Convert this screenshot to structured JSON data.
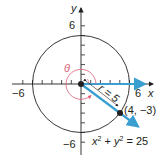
{
  "figure": {
    "axes": {
      "x_label": "x",
      "y_label": "y",
      "x_min_label": "−6",
      "x_max_label": "6",
      "y_max_label": "6",
      "y_min_label": "−6",
      "range": [
        -6,
        6
      ]
    },
    "circle": {
      "equation_lhs": "x",
      "equation_full": "x² + y² = 25",
      "radius": 5
    },
    "point": {
      "label": "(4, −3)",
      "x": 4,
      "y": -3
    },
    "radius_label": "r = 5",
    "angle_label": "θ",
    "colors": {
      "ray": "#3a9fd0",
      "angle": "#e0607a",
      "ink": "#231f20"
    }
  }
}
